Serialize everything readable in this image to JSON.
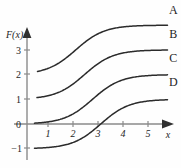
{
  "figure": {
    "background_color": "#fefefe",
    "curve_color": "#2b2b2b",
    "axis_color": "#8a8a8a",
    "y_axis_label": "F(x)",
    "x_axis_label": "x"
  },
  "chart_data": {
    "type": "line",
    "title": "",
    "subtitle": "",
    "xlabel": "x",
    "ylabel": "F(x)",
    "xlim": [
      0,
      6
    ],
    "ylim": [
      -1.6,
      4.6
    ],
    "grid": false,
    "legend_position": "inline-right-of-curve",
    "x_ticks": [
      1,
      2,
      3,
      4,
      5
    ],
    "x_tick_labels": [
      "1",
      "2",
      "3",
      "4",
      "5"
    ],
    "y_ticks": [
      -1,
      0,
      1,
      2,
      3
    ],
    "y_tick_labels": [
      "−1",
      "0",
      "1",
      "2",
      "3"
    ],
    "annotations": [
      "A",
      "B",
      "C",
      "D"
    ],
    "series": [
      {
        "name": "A",
        "label": "A",
        "baseline": 2,
        "plateau": 4,
        "midpoint_x": 1.95,
        "steepness": 1.75,
        "x_start": 0.42,
        "x_end": 5.62,
        "label_x": 5.85,
        "label_y": 4.45
      },
      {
        "name": "B",
        "label": "B",
        "baseline": 1,
        "plateau": 3,
        "midpoint_x": 2.3,
        "steepness": 1.75,
        "x_start": 0.4,
        "x_end": 5.62,
        "label_x": 5.85,
        "label_y": 3.48
      },
      {
        "name": "C",
        "label": "C",
        "baseline": 0,
        "plateau": 2,
        "midpoint_x": 2.62,
        "steepness": 1.75,
        "x_start": 0.3,
        "x_end": 5.62,
        "label_x": 5.85,
        "label_y": 2.52
      },
      {
        "name": "D",
        "label": "D",
        "baseline": -1,
        "plateau": 1,
        "midpoint_x": 2.95,
        "steepness": 1.75,
        "x_start": 0.3,
        "x_end": 5.62,
        "label_x": 5.85,
        "label_y": 1.55
      }
    ]
  }
}
